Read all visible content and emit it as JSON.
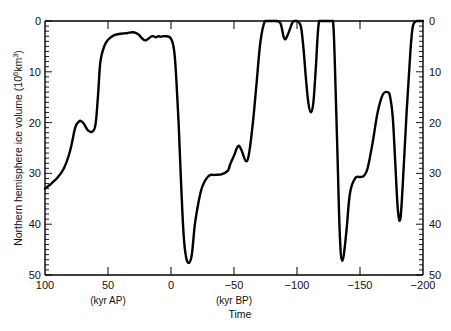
{
  "chart_data": {
    "type": "line",
    "title": "",
    "xlabel": "Time",
    "ylabel": "Northern hemisphere ice volume (10^6 km^3)",
    "x_unit_labels": [
      {
        "text": "(kyr AP)",
        "at": 50
      },
      {
        "text": "(kyr BP)",
        "at": -50
      }
    ],
    "xlim": [
      100,
      -200
    ],
    "ylim": [
      0,
      50
    ],
    "y_inverted": true,
    "x_ticks": [
      100,
      50,
      0,
      -50,
      -100,
      -150,
      -200
    ],
    "x_tick_labels": [
      "100",
      "50",
      "0",
      "−50",
      "−100",
      "−150",
      "−200"
    ],
    "y_ticks": [
      0,
      10,
      20,
      30,
      40,
      50
    ],
    "y_tick_labels": [
      "0",
      "10",
      "20",
      "30",
      "40",
      "50"
    ],
    "y_minor_step": 1,
    "grid": false,
    "legend": null,
    "series": [
      {
        "name": "Northern hemisphere ice volume",
        "color": "#000000",
        "x": [
          100,
          95,
          90,
          85,
          80,
          76,
          73,
          71.4,
          69,
          66,
          62.7,
          60,
          58,
          56,
          53,
          50,
          45,
          40,
          35,
          30,
          26,
          23,
          20,
          15,
          12,
          10,
          8,
          5,
          0,
          -3,
          -6,
          -8,
          -10,
          -12,
          -14.3,
          -16.5,
          -19,
          -22,
          -25,
          -30,
          -35,
          -40,
          -45,
          -47,
          -50,
          -53.3,
          -56,
          -59.5,
          -62,
          -65,
          -68,
          -71,
          -74.6,
          -80,
          -84,
          -87,
          -90,
          -93,
          -96,
          -97.6,
          -100,
          -103,
          -105,
          -107,
          -109,
          -111,
          -113,
          -115,
          -117.5,
          -122,
          -126,
          -128.6,
          -130,
          -132,
          -134,
          -136,
          -139,
          -142,
          -146,
          -150,
          -153,
          -156,
          -160,
          -164,
          -168,
          -172,
          -174,
          -176,
          -178,
          -180,
          -182,
          -184,
          -187,
          -190,
          -192,
          -195,
          -200
        ],
        "values": [
          33,
          32,
          30.8,
          29,
          25.5,
          21,
          19.8,
          19.7,
          20.3,
          21.5,
          21.8,
          20.5,
          15,
          8,
          5,
          3.7,
          2.8,
          2.5,
          2.4,
          2.2,
          2.6,
          3.4,
          3.8,
          3.0,
          3.2,
          3.0,
          3.1,
          3.0,
          3.5,
          7,
          20,
          32,
          42,
          46.5,
          47.6,
          46,
          40,
          35.5,
          32.5,
          30.5,
          30.3,
          30.2,
          29.5,
          28.2,
          26.5,
          24.6,
          25.5,
          27.6,
          26,
          20,
          12,
          4,
          0,
          0,
          0,
          0.5,
          3.5,
          2.5,
          0.5,
          0,
          0,
          1,
          5,
          11,
          16,
          18,
          16,
          9,
          0,
          0,
          0,
          0,
          8,
          25,
          42,
          47.2,
          42,
          34,
          31,
          30.7,
          30.5,
          29,
          24,
          18,
          14.5,
          14,
          15,
          19,
          28,
          37,
          39,
          32,
          18,
          6,
          1,
          0,
          0
        ]
      }
    ]
  },
  "axes": {
    "left_ticks": [
      "0",
      "10",
      "20",
      "30",
      "40",
      "50"
    ],
    "right_ticks": [
      "0",
      "10",
      "20",
      "30",
      "40",
      "50"
    ],
    "x_ticks": [
      "100",
      "50",
      "0",
      "−50",
      "−100",
      "−150",
      "−200"
    ],
    "y_title": "Northern hemisphere ice volume (10",
    "y_title_sup": "6",
    "y_title_mid": "km",
    "y_title_sup2": "3",
    "y_title_end": ")",
    "x_title": "Time",
    "unit_ap": "(kyr AP)",
    "unit_bp": "(kyr BP)"
  }
}
